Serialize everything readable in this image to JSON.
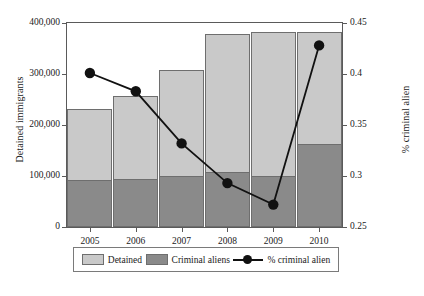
{
  "chart_data": {
    "type": "bar",
    "title": "",
    "categories": [
      "2005",
      "2006",
      "2007",
      "2008",
      "2009",
      "2010"
    ],
    "series": [
      {
        "name": "Detained",
        "axis": "left",
        "values": [
          231000,
          256000,
          308000,
          378000,
          383000,
          383000
        ]
      },
      {
        "name": "Criminal aliens",
        "axis": "left",
        "values": [
          92000,
          95000,
          100000,
          107000,
          100000,
          163000
        ]
      },
      {
        "name": "% criminal alien",
        "axis": "right",
        "values": [
          0.401,
          0.383,
          0.332,
          0.293,
          0.272,
          0.428
        ]
      }
    ],
    "xlabel": "",
    "ylabel": "Detained immigrants",
    "y2label": "% criminal alien",
    "ylim": [
      0,
      400000
    ],
    "y2lim": [
      0.25,
      0.45
    ],
    "yticks": [
      0,
      100000,
      200000,
      300000,
      400000
    ],
    "ytick_labels": [
      "0",
      "100,000",
      "200,000",
      "300,000",
      "400,000"
    ],
    "y2ticks": [
      0.25,
      0.3,
      0.35,
      0.4,
      0.45
    ],
    "y2tick_labels": [
      "0.25",
      "0.3",
      "0.35",
      "0.4",
      "0.45"
    ],
    "grid": false,
    "legend_position": "bottom",
    "stacked": true,
    "colors": {
      "detained": "#c9c9c9",
      "criminal_aliens": "#8a8a8a",
      "line": "#111111",
      "axis": "#5a5a5a"
    }
  },
  "legend": {
    "items": [
      {
        "label": "Detained",
        "marker": "swatch-light"
      },
      {
        "label": "Criminal aliens",
        "marker": "swatch-dark"
      },
      {
        "label": "% criminal alien",
        "marker": "line-with-dot"
      }
    ]
  },
  "caption": ""
}
